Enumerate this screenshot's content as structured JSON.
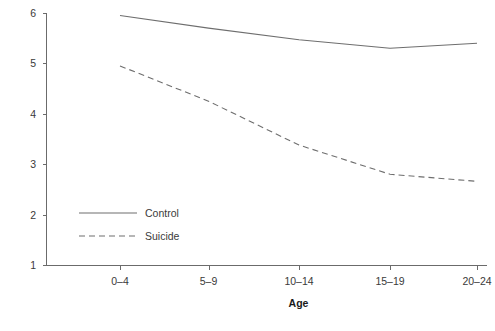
{
  "chart_data": {
    "type": "line",
    "title": "",
    "subtitle": "",
    "xlabel": "Age",
    "ylabel": "",
    "categories": [
      "0–4",
      "5–9",
      "10–14",
      "15–19",
      "20–24"
    ],
    "series": [
      {
        "name": "Control",
        "style": "solid",
        "color": "#6e6e6e",
        "values": [
          5.95,
          5.7,
          5.47,
          5.3,
          5.4
        ]
      },
      {
        "name": "Suicide",
        "style": "dashed",
        "color": "#6e6e6e",
        "values": [
          4.95,
          4.25,
          3.38,
          2.8,
          2.66
        ]
      }
    ],
    "ylim": [
      1,
      6
    ],
    "yticks": [
      1,
      2,
      3,
      4,
      5,
      6
    ],
    "ytick_labels": [
      "1",
      "2",
      "3",
      "4",
      "5",
      "6"
    ],
    "grid": false,
    "legend_position": "inside-lower-left",
    "legend": [
      "Control",
      "Suicide"
    ]
  },
  "axes": {
    "y_tick_labels": [
      "6",
      "5",
      "4",
      "3",
      "2",
      "1"
    ],
    "x_tick_labels": [
      "0–4",
      "5–9",
      "10–14",
      "15–19",
      "20–24"
    ],
    "x_title": "Age"
  },
  "legend": {
    "entries": [
      {
        "label": "Control",
        "style": "solid"
      },
      {
        "label": "Suicide",
        "style": "dashed"
      }
    ]
  }
}
